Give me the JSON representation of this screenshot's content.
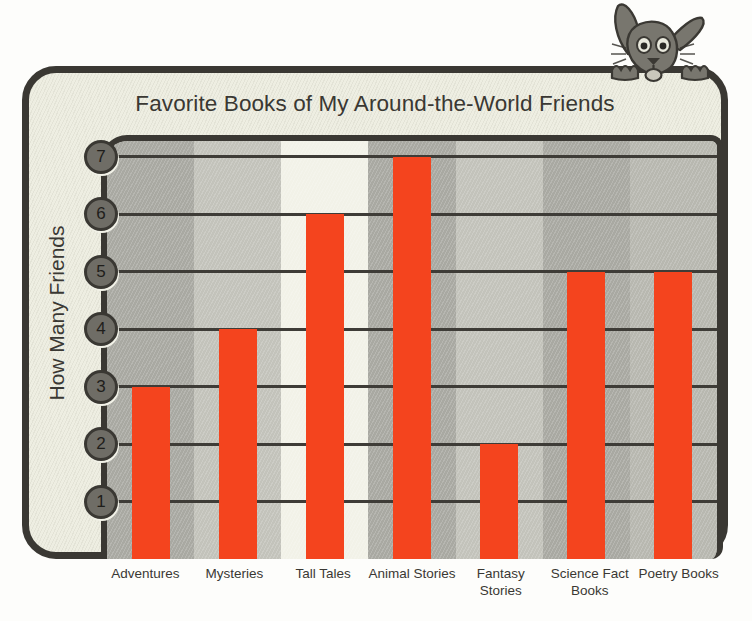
{
  "chart_data": {
    "type": "bar",
    "title": "Favorite Books of My Around-the-World Friends",
    "xlabel": "",
    "ylabel": "How Many Friends",
    "categories": [
      "Adventures",
      "Mysteries",
      "Tall Tales",
      "Animal Stories",
      "Fantasy Stories",
      "Science Fact Books",
      "Poetry Books"
    ],
    "values": [
      3,
      4,
      6,
      7,
      2,
      5,
      5
    ],
    "ylim": [
      0,
      7
    ],
    "yticks": [
      1,
      2,
      3,
      4,
      5,
      6,
      7
    ],
    "ytick_labels": [
      "1",
      "2",
      "3",
      "4",
      "5",
      "6",
      "7"
    ],
    "grid": true,
    "legend": false,
    "bar_color": "#f4441e"
  },
  "colors": {
    "bar": "#f4441e",
    "frame": "#3a3833",
    "panel": "#eeeee2",
    "page_background": "#fdfdfb",
    "badge_fill": "#6f6d66",
    "gridline": "#3e3c37",
    "text": "#3a3833"
  },
  "bands": [
    "#a9a9a2",
    "#c3c3bb",
    "#f2f2e8",
    "#a9a9a2",
    "#c3c3bb",
    "#a9a9a2",
    "#b8b8b0"
  ],
  "x_labels": [
    {
      "line1": "Adventures",
      "line2": ""
    },
    {
      "line1": "Mysteries",
      "line2": ""
    },
    {
      "line1": "Tall Tales",
      "line2": ""
    },
    {
      "line1": "Animal Stories",
      "line2": ""
    },
    {
      "line1": "Fantasy",
      "line2": "Stories"
    },
    {
      "line1": "Science Fact",
      "line2": "Books"
    },
    {
      "line1": "Poetry Books",
      "line2": ""
    }
  ],
  "mascot": {
    "name": "rabbit-mascot"
  }
}
